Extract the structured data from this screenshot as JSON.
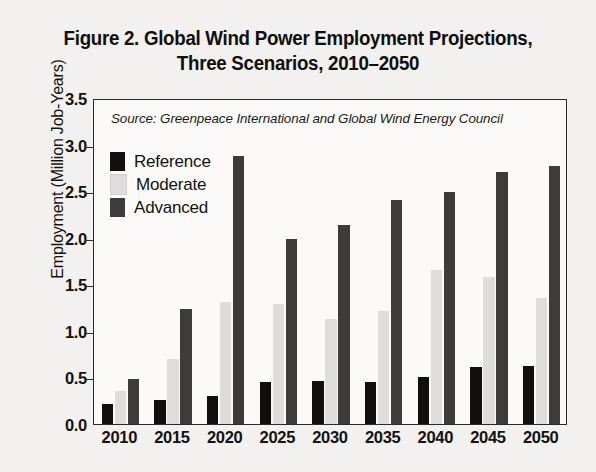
{
  "figure": {
    "title_line1": "Figure 2. Global Wind Power Employment Projections,",
    "title_line2": "Three Scenarios, 2010–2050"
  },
  "source_note": "Source: Greenpeace International and Global Wind Energy Council",
  "legend": {
    "items": [
      {
        "label": "Reference",
        "color": "#100f0d"
      },
      {
        "label": "Moderate",
        "color": "#dedddb"
      },
      {
        "label": "Advanced",
        "color": "#3d3c3a"
      }
    ]
  },
  "axes": {
    "y_title": "Employment (Million Job-Years)",
    "y_ticks": [
      "0.0",
      "0.5",
      "1.0",
      "1.5",
      "2.0",
      "2.5",
      "3.0",
      "3.5"
    ],
    "x_ticks": [
      "2010",
      "2015",
      "2020",
      "2025",
      "2030",
      "2035",
      "2040",
      "2045",
      "2050"
    ]
  },
  "chart_data": {
    "type": "bar",
    "title": "Figure 2. Global Wind Power Employment Projections, Three Scenarios, 2010–2050",
    "xlabel": "",
    "ylabel": "Employment (Million Job-Years)",
    "ylim": [
      0,
      3.5
    ],
    "ytick_step": 0.5,
    "grid": false,
    "legend_position": "upper-left-inside",
    "source": "Greenpeace International and Global Wind Energy Council",
    "categories": [
      "2010",
      "2015",
      "2020",
      "2025",
      "2030",
      "2035",
      "2040",
      "2045",
      "2050"
    ],
    "series": [
      {
        "name": "Reference",
        "color": "#100f0d",
        "values": [
          0.21,
          0.26,
          0.3,
          0.45,
          0.46,
          0.45,
          0.51,
          0.61,
          0.62
        ]
      },
      {
        "name": "Moderate",
        "color": "#dedddb",
        "values": [
          0.35,
          0.7,
          1.31,
          1.29,
          1.13,
          1.21,
          1.65,
          1.58,
          1.35
        ]
      },
      {
        "name": "Advanced",
        "color": "#3d3c3a",
        "values": [
          0.48,
          1.23,
          2.88,
          1.99,
          2.14,
          2.41,
          2.49,
          2.71,
          2.77
        ]
      }
    ]
  }
}
